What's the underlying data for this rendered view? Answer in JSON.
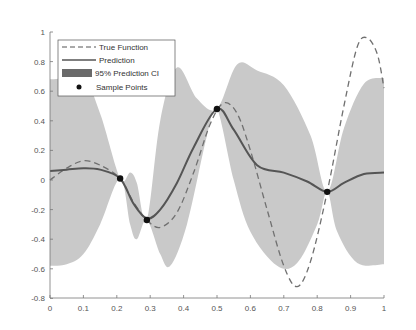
{
  "chart_data": {
    "type": "line",
    "title": "",
    "xlabel": "",
    "ylabel": "",
    "xlim": [
      0,
      1
    ],
    "ylim": [
      -0.8,
      1
    ],
    "grid": false,
    "legend_position": "upper-left",
    "x_ticks": [
      "0",
      "0.1",
      "0.2",
      "0.3",
      "0.4",
      "0.5",
      "0.6",
      "0.7",
      "0.8",
      "0.9",
      "1"
    ],
    "y_ticks": [
      "-0.8",
      "-0.6",
      "-0.4",
      "-0.2",
      "0",
      "0.2",
      "0.4",
      "0.6",
      "0.8",
      "1"
    ],
    "legend": [
      {
        "label": "True Function",
        "style": "dashed"
      },
      {
        "label": "Prediction",
        "style": "solid"
      },
      {
        "label": "95% Prediction CI",
        "style": "fill"
      },
      {
        "label": "Sample Points",
        "style": "marker"
      }
    ],
    "series": [
      {
        "name": "True Function",
        "x": [
          0,
          0.05,
          0.1,
          0.15,
          0.21,
          0.25,
          0.29,
          0.33,
          0.38,
          0.43,
          0.48,
          0.52,
          0.56,
          0.6,
          0.65,
          0.7,
          0.74,
          0.78,
          0.83,
          0.88,
          0.92,
          0.95,
          0.98,
          1
        ],
        "y": [
          0.0,
          0.08,
          0.13,
          0.1,
          0.01,
          -0.15,
          -0.27,
          -0.32,
          -0.22,
          0.05,
          0.38,
          0.52,
          0.45,
          0.2,
          -0.2,
          -0.58,
          -0.72,
          -0.55,
          -0.08,
          0.5,
          0.9,
          0.96,
          0.85,
          0.62
        ]
      },
      {
        "name": "Prediction",
        "x": [
          0,
          0.05,
          0.1,
          0.15,
          0.21,
          0.25,
          0.29,
          0.33,
          0.38,
          0.43,
          0.5,
          0.55,
          0.62,
          0.7,
          0.77,
          0.83,
          0.88,
          0.94,
          1
        ],
        "y": [
          0.06,
          0.07,
          0.08,
          0.07,
          0.01,
          -0.16,
          -0.26,
          -0.2,
          -0.02,
          0.22,
          0.48,
          0.34,
          0.1,
          0.05,
          -0.01,
          -0.08,
          -0.02,
          0.04,
          0.05
        ]
      },
      {
        "name": "Sample Points",
        "x": [
          0.21,
          0.29,
          0.5,
          0.83
        ],
        "y": [
          0.01,
          -0.27,
          0.48,
          -0.08
        ]
      },
      {
        "name": "95% Prediction CI upper",
        "x": [
          0,
          0.1,
          0.15,
          0.21,
          0.24,
          0.26,
          0.29,
          0.33,
          0.38,
          0.44,
          0.5,
          0.56,
          0.62,
          0.7,
          0.78,
          0.83,
          0.88,
          0.94,
          1
        ],
        "y": [
          0.68,
          0.67,
          0.45,
          0.01,
          0.05,
          -0.02,
          -0.27,
          0.4,
          0.76,
          0.55,
          0.48,
          0.78,
          0.74,
          0.64,
          0.3,
          -0.08,
          0.35,
          0.65,
          0.69
        ]
      },
      {
        "name": "95% Prediction CI lower",
        "x": [
          0,
          0.05,
          0.1,
          0.15,
          0.21,
          0.24,
          0.26,
          0.29,
          0.33,
          0.36,
          0.41,
          0.47,
          0.5,
          0.55,
          0.6,
          0.68,
          0.74,
          0.8,
          0.83,
          0.86,
          0.92,
          1
        ],
        "y": [
          -0.58,
          -0.57,
          -0.5,
          -0.3,
          0.01,
          -0.3,
          -0.4,
          -0.27,
          -0.5,
          -0.58,
          -0.3,
          0.3,
          0.48,
          0.0,
          -0.35,
          -0.58,
          -0.56,
          -0.3,
          -0.08,
          -0.35,
          -0.56,
          -0.57
        ]
      }
    ],
    "colors": {
      "ci_fill": "#c8c8c8",
      "ci_legend": "#6a6a6a",
      "prediction": "#5a5a5a",
      "true_function": "#6e6e6e",
      "markers": "#111111",
      "axis": "#777777"
    }
  }
}
